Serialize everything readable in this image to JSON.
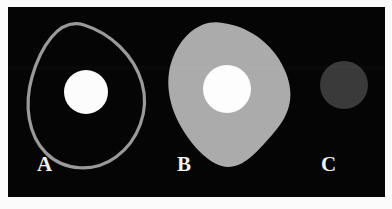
{
  "figure": {
    "background_color": "#fbfbfb",
    "panel_color": "#050505",
    "panels": [
      {
        "label": "A",
        "name": "specimen-a",
        "description": "unfilled rounded-quadrilateral outline with bright circular core",
        "outline_color": "#9a9a9a",
        "outline_width": 3,
        "fill_color": "none",
        "core_color": "#fcfcfc",
        "core_diameter_px": 44,
        "shape_path": "M 60 4 C 86 12 110 34 118 62 C 126 90 114 120 92 136 C 70 152 40 150 22 132 C 4 114 0 84 8 56 C 16 28 34 -4 60 4 Z",
        "core_cx": 62,
        "core_cy": 71,
        "core_r": 22
      },
      {
        "label": "B",
        "name": "specimen-b",
        "description": "solid gray rounded-quadrilateral body with bright circular core",
        "outline_color": "none",
        "outline_width": 0,
        "fill_color": "#ababab",
        "core_color": "#fdfdfd",
        "core_diameter_px": 48,
        "shape_path": "M 63 2 C 92 6 116 26 126 52 C 136 78 128 96 112 114 C 96 132 84 146 68 146 C 52 146 32 126 20 104 C 8 82 4 56 14 34 C 24 12 42 -2 63 2 Z",
        "core_cx": 67,
        "core_cy": 68,
        "core_r": 24
      },
      {
        "label": "C",
        "name": "specimen-c",
        "description": "lone dim gray disc, no surrounding body and no bright core",
        "outline_color": "none",
        "outline_width": 0,
        "fill_color": "#3a3a3a",
        "core_color": "none",
        "core_diameter_px": 48,
        "shape_path": "",
        "core_cx": 44,
        "core_cy": 64,
        "core_r": 24
      }
    ],
    "label_color": "#f2f2f2"
  }
}
